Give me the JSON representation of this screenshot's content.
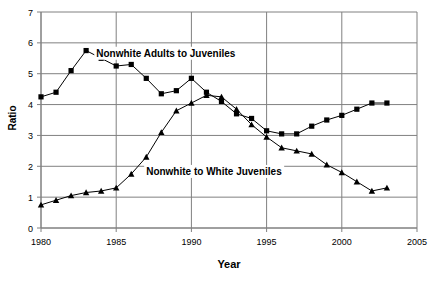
{
  "chart_data": {
    "type": "line",
    "title": "",
    "xlabel": "Year",
    "ylabel": "Ratio",
    "xlim": [
      1980,
      2005
    ],
    "ylim": [
      0,
      7
    ],
    "xticks": [
      1980,
      1985,
      1990,
      1995,
      2000,
      2005
    ],
    "yticks": [
      0,
      1,
      2,
      3,
      4,
      5,
      6,
      7
    ],
    "grid": true,
    "legend_position": "inline-annotations",
    "x": [
      1980,
      1981,
      1982,
      1983,
      1984,
      1985,
      1986,
      1987,
      1988,
      1989,
      1990,
      1991,
      1992,
      1993,
      1994,
      1995,
      1996,
      1997,
      1998,
      1999,
      2000,
      2001,
      2002,
      2003
    ],
    "series": [
      {
        "name": "Nonwhite Adults to Juveniles",
        "marker": "square",
        "values": [
          4.25,
          4.4,
          5.1,
          5.75,
          5.5,
          5.25,
          5.3,
          4.85,
          4.35,
          4.45,
          4.85,
          4.4,
          4.1,
          3.7,
          3.55,
          3.15,
          3.05,
          3.05,
          3.3,
          3.5,
          3.65,
          3.85,
          4.05,
          4.05
        ]
      },
      {
        "name": "Nonwhite to White Juveniles",
        "marker": "triangle",
        "values": [
          0.75,
          0.9,
          1.05,
          1.15,
          1.2,
          1.3,
          1.75,
          2.3,
          3.1,
          3.8,
          4.05,
          4.3,
          4.25,
          3.85,
          3.35,
          2.95,
          2.6,
          2.5,
          2.4,
          2.05,
          1.8,
          1.5,
          1.2,
          1.3
        ]
      }
    ],
    "annotations": [
      {
        "text": "Nonwhite Adults to Juveniles",
        "x": 1988.3,
        "y": 5.55
      },
      {
        "text": "Nonwhite to White Juveniles",
        "x": 1991.5,
        "y": 1.72
      }
    ],
    "colors": {
      "line": "#000000",
      "marker": "#000000",
      "grid": "#808080",
      "axis": "#808080",
      "background": "#ffffff"
    }
  }
}
